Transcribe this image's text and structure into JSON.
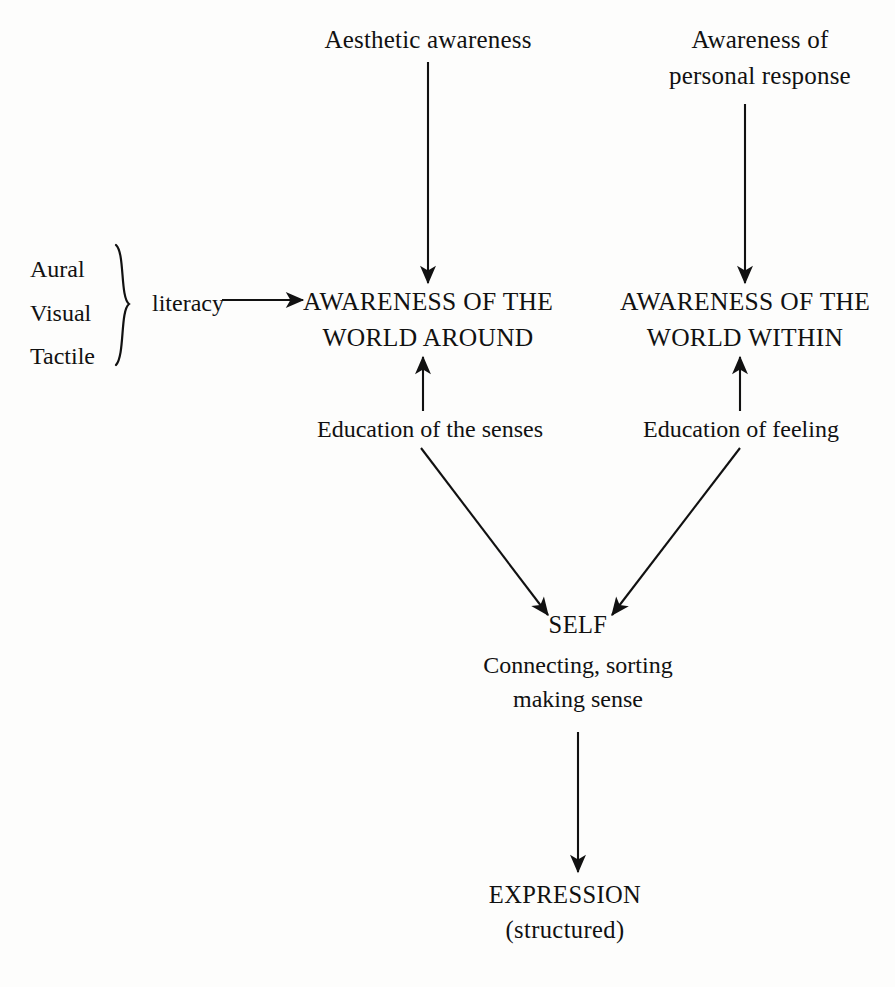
{
  "diagram": {
    "background_color": "#fdfdfc",
    "ink_color": "#111111",
    "nodes": {
      "aesthetic_awareness": {
        "line1": "Aesthetic awareness"
      },
      "awareness_personal_response": {
        "line1": "Awareness of",
        "line2": "personal response"
      },
      "modalities": {
        "item1": "Aural",
        "item2": "Visual",
        "item3": "Tactile"
      },
      "literacy": {
        "label": "literacy"
      },
      "world_around": {
        "line1": "AWARENESS OF THE",
        "line2": "WORLD AROUND"
      },
      "world_within": {
        "line1": "AWARENESS OF THE",
        "line2": "WORLD WITHIN"
      },
      "education_senses": {
        "label": "Education of the senses"
      },
      "education_feeling": {
        "label": "Education of feeling"
      },
      "self": {
        "label": "SELF"
      },
      "connecting": {
        "line1": "Connecting, sorting",
        "line2": "making sense"
      },
      "expression": {
        "line1": "EXPRESSION",
        "line2": "(structured)"
      }
    },
    "connectors": [
      {
        "name": "aesthetic-to-world-around",
        "from": "aesthetic_awareness",
        "to": "world_around",
        "direction": "down"
      },
      {
        "name": "personal-response-to-world-within",
        "from": "awareness_personal_response",
        "to": "world_within",
        "direction": "down"
      },
      {
        "name": "literacy-to-world-around",
        "from": "literacy",
        "to": "world_around",
        "direction": "right"
      },
      {
        "name": "education-senses-to-world-around",
        "from": "education_senses",
        "to": "world_around",
        "direction": "up"
      },
      {
        "name": "education-feeling-to-world-within",
        "from": "education_feeling",
        "to": "world_within",
        "direction": "up"
      },
      {
        "name": "education-senses-to-self",
        "from": "education_senses",
        "to": "self",
        "direction": "down-right"
      },
      {
        "name": "education-feeling-to-self",
        "from": "education_feeling",
        "to": "self",
        "direction": "down-left"
      },
      {
        "name": "self-to-expression",
        "from": "connecting",
        "to": "expression",
        "direction": "down"
      }
    ],
    "brace": {
      "name": "modalities-brace",
      "orientation": "right-facing"
    }
  }
}
